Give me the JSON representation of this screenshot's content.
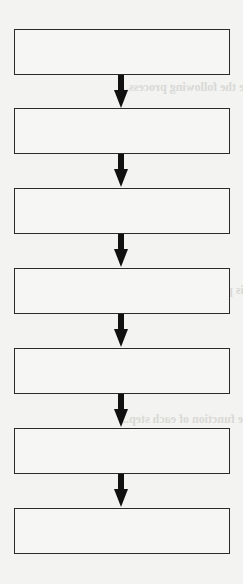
{
  "diagram": {
    "type": "vertical-flowchart",
    "boxes": [
      {
        "label": ""
      },
      {
        "label": ""
      },
      {
        "label": ""
      },
      {
        "label": ""
      },
      {
        "label": ""
      },
      {
        "label": ""
      },
      {
        "label": ""
      }
    ],
    "arrow_count": 6,
    "colors": {
      "border": "#2a2a2a",
      "arrow": "#111111",
      "paper": "#f3f3f1"
    }
  },
  "bleed_through_text": [
    "...briefly describe the following process...",
    "...describe why this process is important...",
    "...the function of each step..."
  ]
}
